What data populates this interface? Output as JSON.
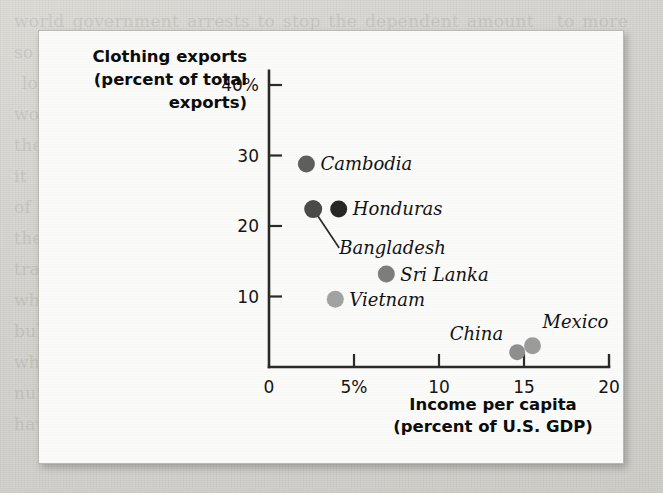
{
  "background": {
    "ghost_text": "world government arrests to stop the dependent amount   to more  so uses on  y-tel have  suctions  for   north\n lower  is   marked work ne  ve                          in   canal  works  in    Pro-  their labor  as      world\nthe   Gregorian outlines  he   conditions  and  the  in which each\nit  on  to   find  an  action  law  for   lost  Chinese    business\nof  production  and  the  over  dividual  and  all\nthey   work.  It  is   that   but  prohibited  to   4 als  which\ntraining wear   in  agriculture   same  with  to household\nwho  tur the  control a  much larger  A  or  the  side\nbull  declines  could  have  else-lustries  rest  in  growth\nwhere  the  middle-income  then  by  deal, meanwhile\nnuissuresent  in    nearly  stabilized  in  have  the\nhave to higher-income rises  of  should  within  able."
  },
  "chart_data": {
    "type": "scatter",
    "title": "",
    "xlabel": "Income per capita\n(percent of U.S. GDP)",
    "xlabel_line1": "Income per capita",
    "xlabel_line2": "(percent of U.S. GDP)",
    "ylabel_line1": "Clothing exports",
    "ylabel_line2": "(percent of total",
    "ylabel_line3": "exports)",
    "xlim": [
      0,
      20
    ],
    "ylim": [
      0,
      42
    ],
    "xticks": [
      0,
      5,
      10,
      15,
      20
    ],
    "xtick_labels": [
      "0",
      "5%",
      "10",
      "15",
      "20"
    ],
    "yticks": [
      10,
      20,
      30,
      40
    ],
    "ytick_labels": [
      "10",
      "20",
      "30",
      "40%"
    ],
    "grid": false,
    "legend": "none",
    "marker_color_default": "#6f6f6f",
    "points": [
      {
        "name": "Cambodia",
        "x": 2.2,
        "y": 28.8,
        "color": "#5e5e5e",
        "radius": 8.5,
        "label": "Cambodia",
        "label_dx": 14,
        "label_dy": 6,
        "anchor": "start",
        "leader": false
      },
      {
        "name": "Bangladesh",
        "x": 2.6,
        "y": 22.4,
        "color": "#4a4a4a",
        "radius": 9.0,
        "label": "Bangladesh",
        "label_dx": 26,
        "label_dy": 45,
        "anchor": "start",
        "leader": true
      },
      {
        "name": "Honduras",
        "x": 4.1,
        "y": 22.4,
        "color": "#272727",
        "radius": 8.5,
        "label": "Honduras",
        "label_dx": 14,
        "label_dy": 6,
        "anchor": "start",
        "leader": false
      },
      {
        "name": "Sri Lanka",
        "x": 6.9,
        "y": 13.2,
        "color": "#7d7d7d",
        "radius": 8.5,
        "label": "Sri Lanka",
        "label_dx": 14,
        "label_dy": 7,
        "anchor": "start",
        "leader": false
      },
      {
        "name": "Vietnam",
        "x": 3.9,
        "y": 9.6,
        "color": "#a2a2a2",
        "radius": 8.5,
        "label": "Vietnam",
        "label_dx": 14,
        "label_dy": 7,
        "anchor": "start",
        "leader": false
      },
      {
        "name": "China",
        "x": 14.6,
        "y": 2.1,
        "color": "#8e8e8e",
        "radius": 8.0,
        "label": "China",
        "label_dx": -14,
        "label_dy": -12,
        "anchor": "end",
        "leader": false
      },
      {
        "name": "Mexico",
        "x": 15.5,
        "y": 3.0,
        "color": "#9b9b9b",
        "radius": 8.5,
        "label": "Mexico",
        "label_dx": 10,
        "label_dy": -18,
        "anchor": "start",
        "leader": false
      }
    ]
  }
}
